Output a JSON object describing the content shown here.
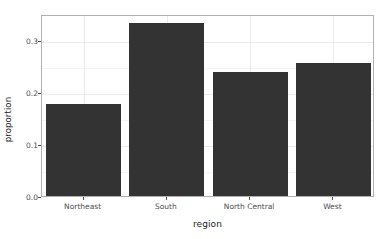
{
  "chart_data": {
    "type": "bar",
    "title": "",
    "subtitle": "",
    "categories": [
      "Northeast",
      "South",
      "North Central",
      "West"
    ],
    "values": [
      0.176,
      0.333,
      0.238,
      0.255
    ],
    "xlabel": "region",
    "ylabel": "proportion",
    "ylim": [
      0.0,
      0.35
    ],
    "xlim_padding": "discrete",
    "y_ticks": [
      "0.0",
      "0.1",
      "0.2",
      "0.3"
    ],
    "y_tick_values": [
      0.0,
      0.1,
      0.2,
      0.3
    ],
    "y_minor_tick_values": [
      0.05,
      0.15,
      0.25
    ],
    "grid": true,
    "grid_major_color": "#ebebeb",
    "grid_minor_color": "#f4f4f4",
    "legend": "none",
    "bar_color": "#333333",
    "panel_border_color": "#b0b0b0",
    "panel_background": "#ffffff",
    "axis_text_color": "#4d4d4d",
    "axis_title_color": "#1a1a1a"
  },
  "axes": {
    "y_title": "proportion",
    "x_title": "region"
  }
}
